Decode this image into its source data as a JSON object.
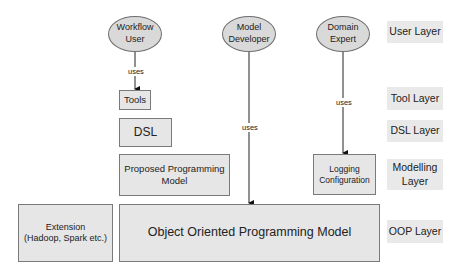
{
  "users": [
    {
      "id": "workflow-user",
      "label_line1": "Workflow",
      "label_line2": "User"
    },
    {
      "id": "model-developer",
      "label_line1": "Model",
      "label_line2": "Developer"
    },
    {
      "id": "domain-expert",
      "label_line1": "Domain",
      "label_line2": "Expert"
    }
  ],
  "boxes": {
    "tools": "Tools",
    "dsl": "DSL",
    "proposed_line1": "Proposed Programming",
    "proposed_line2": "Model",
    "logging_line1": "Logging",
    "logging_line2": "Configuration",
    "extension_line1": "Extension",
    "extension_line2": "(Hadoop, Spark etc.)",
    "oop": "Object Oriented Programming Model"
  },
  "edges": {
    "workflow_uses": "uses",
    "developer_uses": "uses",
    "expert_uses": "uses"
  },
  "layers": {
    "user": "User Layer",
    "tool": "Tool Layer",
    "dsl": "DSL Layer",
    "modelling_line1": "Modelling",
    "modelling_line2": "Layer",
    "oop": "OOP Layer"
  },
  "colors": {
    "box_fill": "#e6e6e6",
    "ellipse_fill": "#d9d9d9",
    "layer_fill": "#e9e9e9",
    "line": "#222222"
  }
}
